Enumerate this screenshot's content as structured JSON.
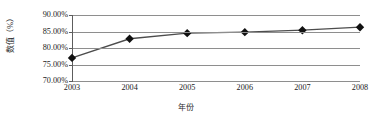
{
  "chart_data": {
    "type": "line",
    "title": "",
    "xlabel": "年份",
    "ylabel": "数值（%）",
    "categories": [
      "2003",
      "2004",
      "2005",
      "2006",
      "2007",
      "2008"
    ],
    "values": [
      77.0,
      82.8,
      84.5,
      84.8,
      85.4,
      86.3
    ],
    "series": [
      {
        "name": "数值",
        "values": [
          77.0,
          82.8,
          84.5,
          84.8,
          85.4,
          86.3
        ]
      }
    ],
    "ylim": [
      70.0,
      90.0
    ],
    "ytick_labels": [
      "90.00%",
      "85.00%",
      "80.00%",
      "75.00%",
      "70.00%"
    ],
    "ytick_values": [
      90.0,
      85.0,
      80.0,
      75.0,
      70.0
    ],
    "grid": true,
    "legend": false,
    "marker": "diamond",
    "marker_color": "#111111",
    "line_color": "#4d4d4d",
    "gridline_color": "#8e8e8e",
    "background_color": "#ffffff"
  }
}
